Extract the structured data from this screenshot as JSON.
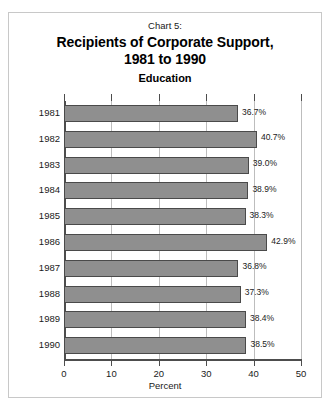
{
  "chart_data": {
    "type": "bar",
    "orientation": "horizontal",
    "chart_label": "Chart 5:",
    "title": "Recipients of Corporate Support,\n1981 to 1990",
    "title_line1": "Recipients of Corporate Support,",
    "title_line2": "1981 to 1990",
    "subtitle": "Education",
    "xlabel": "Percent",
    "ylabel": "",
    "categories": [
      "1981",
      "1982",
      "1983",
      "1984",
      "1985",
      "1986",
      "1987",
      "1988",
      "1989",
      "1990"
    ],
    "values": [
      36.7,
      40.7,
      39.0,
      38.9,
      38.3,
      42.9,
      36.8,
      37.3,
      38.4,
      38.5
    ],
    "value_labels": [
      "36.7%",
      "40.7%",
      "39.0%",
      "38.9%",
      "38.3%",
      "42.9%",
      "36.8%",
      "37.3%",
      "38.4%",
      "38.5%"
    ],
    "xlim": [
      0,
      50
    ],
    "xticks": [
      0,
      10,
      20,
      30,
      40,
      50
    ],
    "xtick_labels": [
      "0",
      "10",
      "20",
      "30",
      "40",
      "50"
    ],
    "grid": true,
    "grid_axis": "x",
    "legend": null,
    "colors": {
      "bar_fill": "#8f8f8f",
      "bar_edge": "#4a4a4a",
      "gridline": "#bdbdbd",
      "axis": "#4d4d4d",
      "text": "#1a1a1a",
      "border": "#c8c8c8",
      "background": "#ffffff"
    }
  }
}
